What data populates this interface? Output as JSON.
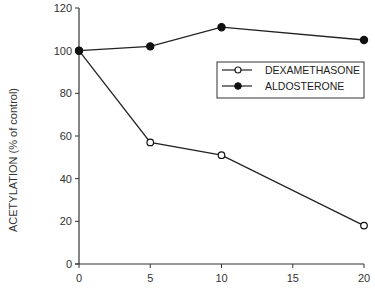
{
  "chart_data": {
    "type": "line",
    "title": "",
    "xlabel": "",
    "ylabel": "ACETYLATION (% of control)",
    "x": [
      0,
      5,
      10,
      20
    ],
    "xlim": [
      0,
      20
    ],
    "ylim": [
      0,
      120
    ],
    "xticks": [
      0,
      5,
      10,
      15,
      20
    ],
    "yticks": [
      0,
      20,
      40,
      60,
      80,
      100,
      120
    ],
    "grid": false,
    "legend_position": "upper right (inside)",
    "series": [
      {
        "name": "DEXAMETHASONE",
        "marker": "open-circle",
        "values": [
          100,
          57,
          51,
          18
        ]
      },
      {
        "name": "ALDOSTERONE",
        "marker": "filled-circle",
        "values": [
          100,
          102,
          111,
          105
        ]
      }
    ]
  },
  "colors": {
    "line": "#222222",
    "axis": "#333333",
    "background": "#ffffff"
  }
}
